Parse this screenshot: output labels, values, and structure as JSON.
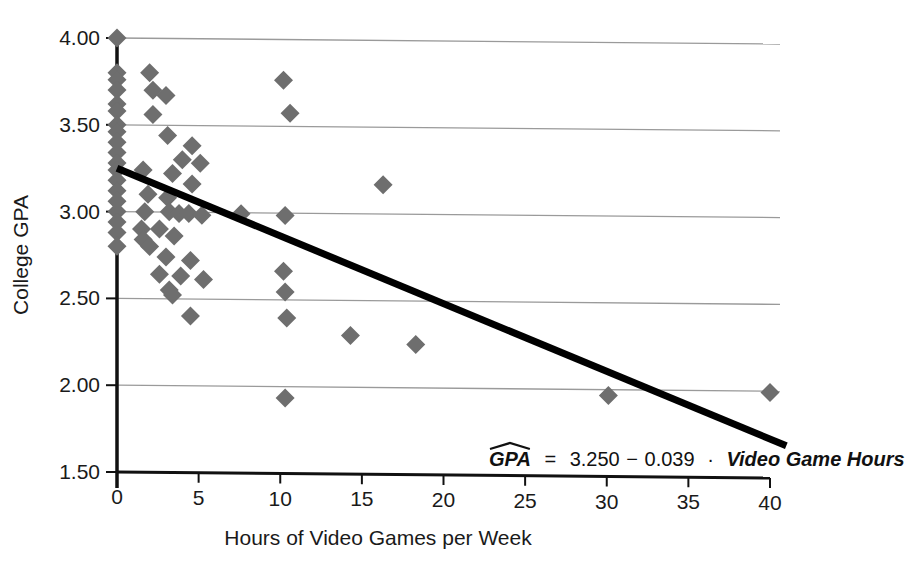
{
  "chart_data": {
    "type": "scatter",
    "title": "",
    "xlabel": "Hours of Video Games per Week",
    "ylabel": "College GPA",
    "xlim": [
      0,
      40
    ],
    "ylim": [
      1.5,
      4.0
    ],
    "xticks": [
      "0",
      "5",
      "10",
      "15",
      "20",
      "25",
      "30",
      "35",
      "40"
    ],
    "xtick_values": [
      0,
      5,
      10,
      15,
      20,
      25,
      30,
      35,
      40
    ],
    "yticks": [
      "1.50",
      "2.00",
      "2.50",
      "3.00",
      "3.50",
      "4.00"
    ],
    "ytick_values": [
      1.5,
      2.0,
      2.5,
      3.0,
      3.5,
      4.0
    ],
    "grid": "horizontal",
    "legend": "none",
    "marker": "diamond",
    "marker_color": "#6e6e6e",
    "trendline_color": "#000000",
    "annotation": {
      "equation_response": "GPA",
      "equation_hat": true,
      "equation_equals": "=",
      "equation_intercept": "3.250",
      "equation_minus": "−",
      "equation_slope": "0.039",
      "equation_dot": "·",
      "equation_predictor": "Video Game Hours",
      "equation_full": "GPA = 3.250−0.039 · Video Game Hours"
    },
    "trendline": {
      "intercept": 3.25,
      "slope": -0.039,
      "x_start": 0,
      "x_end": 41,
      "y_start": 3.25,
      "y_end": 1.651
    },
    "points": [
      {
        "x": 0.0,
        "y": 4.0
      },
      {
        "x": 0.0,
        "y": 3.8
      },
      {
        "x": 0.0,
        "y": 3.76
      },
      {
        "x": 0.0,
        "y": 3.7
      },
      {
        "x": 0.0,
        "y": 3.62
      },
      {
        "x": 0.0,
        "y": 3.58
      },
      {
        "x": 0.0,
        "y": 3.5
      },
      {
        "x": 0.0,
        "y": 3.46
      },
      {
        "x": 0.0,
        "y": 3.4
      },
      {
        "x": 0.0,
        "y": 3.34
      },
      {
        "x": 0.0,
        "y": 3.28
      },
      {
        "x": 0.0,
        "y": 3.24
      },
      {
        "x": 0.0,
        "y": 3.18
      },
      {
        "x": 0.0,
        "y": 3.12
      },
      {
        "x": 0.0,
        "y": 3.06
      },
      {
        "x": 0.0,
        "y": 3.0
      },
      {
        "x": 0.0,
        "y": 2.94
      },
      {
        "x": 0.0,
        "y": 2.88
      },
      {
        "x": 0.0,
        "y": 2.8
      },
      {
        "x": 2.0,
        "y": 3.8
      },
      {
        "x": 2.2,
        "y": 3.7
      },
      {
        "x": 3.0,
        "y": 3.67
      },
      {
        "x": 2.2,
        "y": 3.56
      },
      {
        "x": 3.1,
        "y": 3.44
      },
      {
        "x": 4.6,
        "y": 3.38
      },
      {
        "x": 4.0,
        "y": 3.3
      },
      {
        "x": 5.1,
        "y": 3.28
      },
      {
        "x": 1.6,
        "y": 3.24
      },
      {
        "x": 3.4,
        "y": 3.22
      },
      {
        "x": 4.6,
        "y": 3.16
      },
      {
        "x": 1.9,
        "y": 3.1
      },
      {
        "x": 3.1,
        "y": 3.08
      },
      {
        "x": 1.7,
        "y": 3.0
      },
      {
        "x": 3.2,
        "y": 3.0
      },
      {
        "x": 3.8,
        "y": 2.99
      },
      {
        "x": 4.4,
        "y": 2.99
      },
      {
        "x": 5.2,
        "y": 2.98
      },
      {
        "x": 7.6,
        "y": 2.99
      },
      {
        "x": 10.3,
        "y": 2.98
      },
      {
        "x": 1.5,
        "y": 2.9
      },
      {
        "x": 2.6,
        "y": 2.9
      },
      {
        "x": 1.6,
        "y": 2.84
      },
      {
        "x": 3.5,
        "y": 2.86
      },
      {
        "x": 2.0,
        "y": 2.8
      },
      {
        "x": 3.0,
        "y": 2.74
      },
      {
        "x": 4.5,
        "y": 2.72
      },
      {
        "x": 2.6,
        "y": 2.64
      },
      {
        "x": 3.9,
        "y": 2.63
      },
      {
        "x": 5.3,
        "y": 2.61
      },
      {
        "x": 10.2,
        "y": 2.66
      },
      {
        "x": 3.2,
        "y": 2.55
      },
      {
        "x": 3.4,
        "y": 2.52
      },
      {
        "x": 10.3,
        "y": 2.54
      },
      {
        "x": 4.5,
        "y": 2.4
      },
      {
        "x": 10.4,
        "y": 2.39
      },
      {
        "x": 10.2,
        "y": 3.76
      },
      {
        "x": 10.6,
        "y": 3.57
      },
      {
        "x": 16.3,
        "y": 3.16
      },
      {
        "x": 14.3,
        "y": 2.29
      },
      {
        "x": 18.3,
        "y": 2.24
      },
      {
        "x": 10.3,
        "y": 1.93
      },
      {
        "x": 30.1,
        "y": 1.95
      },
      {
        "x": 40.0,
        "y": 1.97
      }
    ]
  },
  "geometry": {
    "plot_left_px": 117,
    "plot_right_px": 770,
    "plot_top_px": 38,
    "plot_bottom_px": 472,
    "grid_tilt_px": 6
  }
}
